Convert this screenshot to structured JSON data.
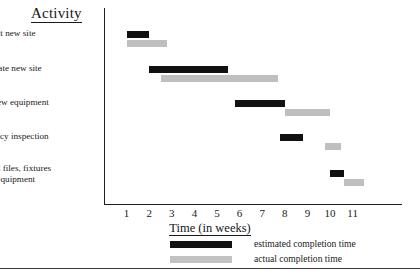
{
  "chart_data": {
    "type": "bar",
    "subtype": "gantt",
    "title": "Activity",
    "xlabel": "Time (in weeks)",
    "ylabel": "Activity",
    "xlim": [
      0,
      12.2
    ],
    "xticks": [
      1,
      2,
      3,
      4,
      5,
      6,
      7,
      8,
      9,
      10,
      11
    ],
    "xtick_labels": [
      "1",
      "2",
      "3",
      "4",
      "5",
      "6",
      "7",
      "8",
      "9",
      "10",
      "11"
    ],
    "grid": false,
    "legend_position": "bottom",
    "categories": [
      "Select new site",
      "Renovate new site",
      "Install new equipment",
      "Occupancy inspection",
      "Move old files, fixtures\nand equipment"
    ],
    "series": [
      {
        "name": "estimated completion time",
        "color": "#111111",
        "spans": [
          {
            "start": 1.0,
            "end": 2.0
          },
          {
            "start": 2.0,
            "end": 5.5
          },
          {
            "start": 5.8,
            "end": 8.0
          },
          {
            "start": 7.8,
            "end": 8.8
          },
          {
            "start": 10.0,
            "end": 10.6
          }
        ]
      },
      {
        "name": "actual completion time",
        "color": "#bfbfbf",
        "spans": [
          {
            "start": 1.0,
            "end": 2.8
          },
          {
            "start": 2.5,
            "end": 7.7
          },
          {
            "start": 8.0,
            "end": 10.0
          },
          {
            "start": 9.8,
            "end": 10.5
          },
          {
            "start": 10.6,
            "end": 11.5
          }
        ]
      }
    ]
  },
  "axis": {
    "title_text": "Time (in weeks)"
  },
  "heading": {
    "text": "Activity"
  },
  "rows": [
    {
      "label": "Select new site"
    },
    {
      "label": "Renovate new site"
    },
    {
      "label": "Install new equipment"
    },
    {
      "label": "Occupancy inspection"
    },
    {
      "label": "Move old files, fixtures\nand equipment"
    }
  ],
  "ticks": [
    {
      "label": "1"
    },
    {
      "label": "2"
    },
    {
      "label": "3"
    },
    {
      "label": "4"
    },
    {
      "label": "5"
    },
    {
      "label": "6"
    },
    {
      "label": "7"
    },
    {
      "label": "8"
    },
    {
      "label": "9"
    },
    {
      "label": "10"
    },
    {
      "label": "11"
    }
  ],
  "legend": {
    "items": [
      {
        "label": "estimated completion time",
        "kind": "estimated"
      },
      {
        "label": "actual completion time",
        "kind": "actual"
      }
    ]
  },
  "colors": {
    "estimated": "#111111",
    "actual": "#bfbfbf",
    "axis": "#1d1d1d",
    "text": "#1b1b1b",
    "background": "#ffffff"
  }
}
